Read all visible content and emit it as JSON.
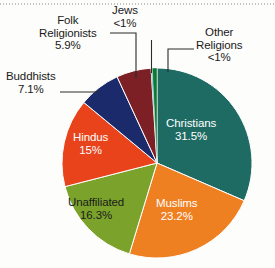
{
  "chart_data": {
    "type": "pie",
    "title": "",
    "subtitle": "",
    "xlabel": "",
    "ylabel": "",
    "legend_position": "none",
    "grid": false,
    "units": "percent",
    "total": 100,
    "start_angle_deg": -90,
    "direction": "clockwise",
    "categories": [
      "Christians",
      "Muslims",
      "Unaffiliated",
      "Hindus",
      "Buddhists",
      "Folk Religionists",
      "Other Religions",
      "Jews"
    ],
    "values": [
      31.5,
      23.2,
      16.3,
      15,
      7.1,
      5.9,
      0.8,
      0.2
    ],
    "slices": [
      {
        "name": "Christians",
        "label": "Christians",
        "value": 31.5,
        "value_text": "31.5%",
        "color": "#1e6b63",
        "label_placement": "inside",
        "label_color": "light"
      },
      {
        "name": "Muslims",
        "label": "Muslims",
        "value": 23.2,
        "value_text": "23.2%",
        "color": "#ef8022",
        "label_placement": "inside",
        "label_color": "light"
      },
      {
        "name": "Unaffiliated",
        "label": "Unaffiliated",
        "value": 16.3,
        "value_text": "16.3%",
        "color": "#7ba32b",
        "label_placement": "inside",
        "label_color": "dark"
      },
      {
        "name": "Hindus",
        "label": "Hindus",
        "value": 15,
        "value_text": "15%",
        "color": "#e8431b",
        "label_placement": "inside",
        "label_color": "light"
      },
      {
        "name": "Buddhists",
        "label": "Buddhists",
        "value": 7.1,
        "value_text": "7.1%",
        "color": "#1b2a6b",
        "label_placement": "outside",
        "label_color": "dark"
      },
      {
        "name": "Folk Religionists",
        "label": "Folk Religionists",
        "label_line1": "Folk",
        "label_line2": "Religionists",
        "value": 5.9,
        "value_text": "5.9%",
        "color": "#7c2026",
        "label_placement": "outside",
        "label_color": "dark"
      },
      {
        "name": "Jews",
        "label": "Jews",
        "value": 0.2,
        "value_text": "<1%",
        "color": "#1f9fd0",
        "label_placement": "outside",
        "label_color": "dark"
      },
      {
        "name": "Other Religions",
        "label": "Other Religions",
        "label_line1": "Other",
        "label_line2": "Religions",
        "value": 0.8,
        "value_text": "<1%",
        "color": "#0d7a31",
        "label_placement": "outside",
        "label_color": "dark"
      }
    ],
    "geometry": {
      "center_x": 157,
      "center_y": 163,
      "radius": 95
    },
    "colors": {
      "background": "#fdfdfb",
      "text": "#1a1a1a",
      "leader_line": "#2b2b2b"
    }
  }
}
